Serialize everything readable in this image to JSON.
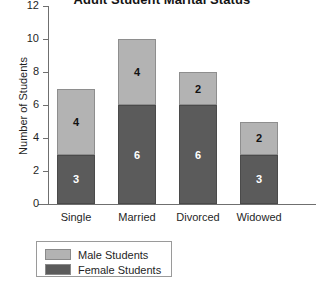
{
  "chart_data": {
    "type": "bar",
    "subtype": "stacked",
    "title": "Adult Student Marital Status",
    "xlabel": "",
    "ylabel": "Number of Students",
    "categories": [
      "Single",
      "Married",
      "Divorced",
      "Widowed"
    ],
    "series": [
      {
        "name": "Female Students",
        "values": [
          3,
          6,
          6,
          3
        ],
        "color": "#5b5b5b",
        "stack_order": 0
      },
      {
        "name": "Male Students",
        "values": [
          4,
          4,
          2,
          2
        ],
        "color": "#b3b3b3",
        "stack_order": 1
      }
    ],
    "totals": [
      7,
      10,
      8,
      5
    ],
    "ylim": [
      0,
      12
    ],
    "yticks": [
      "0",
      "2",
      "4",
      "6",
      "8",
      "10",
      "12"
    ],
    "ytick_values": [
      0,
      2,
      4,
      6,
      8,
      10,
      12
    ],
    "grid": false,
    "legend_position": "bottom-left",
    "data_labels": true
  },
  "legend": {
    "items": [
      {
        "label": "Male Students",
        "color": "#b3b3b3"
      },
      {
        "label": "Female Students",
        "color": "#5b5b5b"
      }
    ]
  }
}
